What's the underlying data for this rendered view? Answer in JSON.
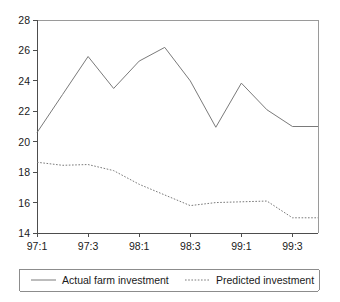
{
  "chart_data": {
    "type": "line",
    "title": "",
    "subtitle": "",
    "xlabel": "",
    "ylabel": "",
    "grid": false,
    "legend_position": "bottom",
    "x": [
      "97:1",
      "97:2",
      "97:3",
      "97:4",
      "98:1",
      "98:2",
      "98:3",
      "98:4",
      "99:1",
      "99:2",
      "99:3",
      "99:4"
    ],
    "xtick_labels": [
      "97:1",
      "97:3",
      "98:1",
      "98:3",
      "99:1",
      "99:3"
    ],
    "xtick_indices": [
      0,
      2,
      4,
      6,
      8,
      10
    ],
    "ytick_labels": [
      "14",
      "16",
      "18",
      "20",
      "22",
      "24",
      "26",
      "28"
    ],
    "ylim": [
      14,
      28
    ],
    "xlim_index": [
      0,
      11
    ],
    "series": [
      {
        "name": "Actual farm investment",
        "style": "solid",
        "color": "#7a7a7a",
        "values": [
          20.6,
          23.1,
          25.6,
          23.5,
          25.3,
          26.2,
          24.0,
          20.95,
          23.85,
          22.1,
          21.0,
          21.0
        ]
      },
      {
        "name": "Predicted investment",
        "style": "dotted",
        "color": "#7a7a7a",
        "values": [
          18.65,
          18.45,
          18.5,
          18.1,
          17.2,
          16.5,
          15.8,
          16.0,
          16.05,
          16.1,
          15.0,
          15.0
        ]
      }
    ]
  },
  "legend": {
    "items": [
      {
        "label": "Actual farm investment",
        "style": "solid"
      },
      {
        "label": "Predicted investment",
        "style": "dotted"
      }
    ]
  },
  "axes": {
    "y_ticks": [
      "28",
      "26",
      "24",
      "22",
      "20",
      "18",
      "16",
      "14"
    ],
    "x_ticks": [
      "97:1",
      "97:3",
      "98:1",
      "98:3",
      "99:1",
      "99:3"
    ]
  }
}
